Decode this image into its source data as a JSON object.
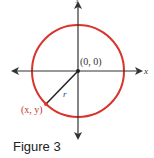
{
  "figure": {
    "caption": "Figure 3",
    "origin_label": "(0, 0)",
    "point_label": "(x, y)",
    "radius_label": "r",
    "x_axis_label": "x",
    "y_axis_label": "y",
    "colors": {
      "circle": "#d9342b",
      "axes": "#333333",
      "radius_line": "#222222",
      "radius_label": "#2b3a8f",
      "point_label": "#c0392b"
    }
  }
}
